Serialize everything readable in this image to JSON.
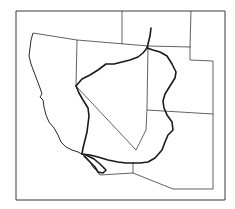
{
  "map": {
    "width": 235,
    "height": 209,
    "colors": {
      "background": "#ffffff",
      "line": "#3a3a3a",
      "basin": "#1a1a1a"
    },
    "frame": "M16 11 L225 11 L225 200 L16 200 Z",
    "state_borders": [
      {
        "name": "ca-nv-north-border",
        "d": "M33 33 L77 40 L148 46 L191 47"
      },
      {
        "name": "nv-ca-line",
        "d": "M77 40 L76 86 L136 150"
      },
      {
        "name": "nv-ut-line",
        "d": "M148 46 L147 108 L146 130 L136 150"
      },
      {
        "name": "id-nv-ut-top-border-left",
        "d": "M122 11 L122 44"
      },
      {
        "name": "wy-ut-line",
        "d": "M191 11 L190 47 L190 60 L213 61 L213 114"
      },
      {
        "name": "ut-az-line",
        "d": "M147 110 L213 114"
      },
      {
        "name": "az-mexico-line",
        "d": "M133 164 L133 173 L173 189 L213 189 L213 114"
      },
      {
        "name": "ca-mexico-line",
        "d": "M100 175 L133 173"
      }
    ],
    "coastline": "M33 33 L31 40 L30 48 L29 56 L31 64 L34 72 L37 80 L40 88 L42 94 L40 97 L43 100 L44 107 L46 115 L49 122 L54 128 L58 135 L61 142 L66 147 L72 150 L78 152 L82 154 L86 157 L90 162 L93 167 L97 171 L100 175",
    "basin_outline": [
      {
        "name": "basin-west-rim",
        "d": "M76 86 L79 93 L83 100 L88 108 L89 116 L88 124 L87 132 L85 140 L83 148 L82 154"
      },
      {
        "name": "basin-north-rim",
        "d": "M76 86 L82 79 L90 75 L98 70 L106 64 L114 64 L122 62 L130 60 L138 57 L143 53 L147 48"
      },
      {
        "name": "basin-east-rim",
        "d": "M147 48 L153 50 L160 52 L167 56 L172 64 L176 72 L175 78 L170 86 L165 94 L163 101 L164 108 L167 115 L172 122 L173 130 L168 135 L165 142 L162 150 L155 158 L148 162 L140 163 L133 163"
      },
      {
        "name": "basin-south-rim",
        "d": "M82 154 L90 155 L98 157 L108 160 L118 162 L126 163 L133 163"
      },
      {
        "name": "green-river-headwater",
        "d": "M147 48 L150 36 L151 28"
      },
      {
        "name": "estuary-channel",
        "d": "M84 156 L90 162 L95 167 L98 172 L103 173 L106 170 L100 164 L94 159 L86 155"
      }
    ]
  }
}
